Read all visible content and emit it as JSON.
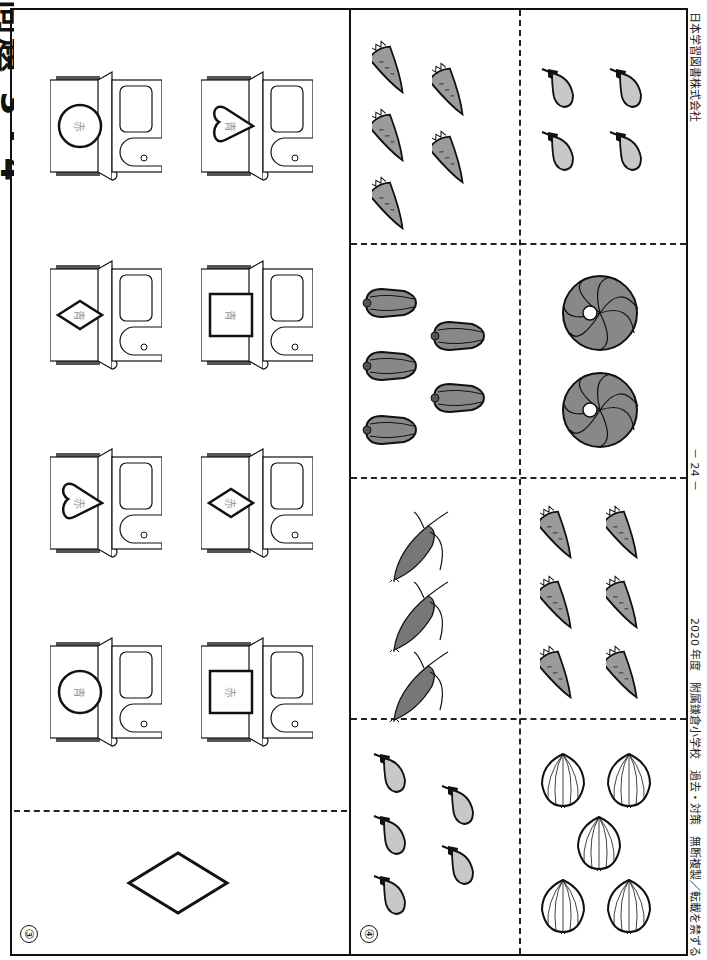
{
  "page": {
    "orientation": "rotated-90",
    "title_fragment": "問題 3・4",
    "page_number": "－ 24 －",
    "publisher": "日本学習図書株式会社",
    "footer_left": "2020 年度　附属鎌倉小学校　過去・対策　無断複製／転載を禁ずる"
  },
  "panel3": {
    "label": "③",
    "sample_shape": "diamond",
    "houses": [
      {
        "row": 1,
        "col": 1,
        "shape": "circle",
        "text": "赤"
      },
      {
        "row": 1,
        "col": 2,
        "shape": "heart",
        "text": "青"
      },
      {
        "row": 2,
        "col": 1,
        "shape": "diamond",
        "text": "青"
      },
      {
        "row": 2,
        "col": 2,
        "shape": "square",
        "text": "青"
      },
      {
        "row": 3,
        "col": 1,
        "shape": "heart",
        "text": "赤"
      },
      {
        "row": 3,
        "col": 2,
        "shape": "diamond",
        "text": "赤"
      },
      {
        "row": 4,
        "col": 1,
        "shape": "circle",
        "text": "青"
      },
      {
        "row": 4,
        "col": 2,
        "shape": "square",
        "text": "赤"
      }
    ]
  },
  "panel4": {
    "label": "④",
    "cells": [
      {
        "row": 1,
        "col": 1,
        "item": "carrot",
        "count": 5
      },
      {
        "row": 1,
        "col": 2,
        "item": "eggplant",
        "count": 4
      },
      {
        "row": 2,
        "col": 1,
        "item": "bell-pepper",
        "count": 5
      },
      {
        "row": 2,
        "col": 2,
        "item": "pumpkin",
        "count": 2
      },
      {
        "row": 3,
        "col": 1,
        "item": "corn",
        "count": 3
      },
      {
        "row": 3,
        "col": 2,
        "item": "carrot",
        "count": 6
      },
      {
        "row": 4,
        "col": 1,
        "item": "eggplant",
        "count": 5
      },
      {
        "row": 4,
        "col": 2,
        "item": "onion",
        "count": 5
      }
    ]
  },
  "colors": {
    "ink": "#111111",
    "veg_fill": "#9b9b9b",
    "eggplant_fill": "#c8c8c8",
    "label_gray": "#9a9a9a",
    "roof_dark": "#555555"
  }
}
